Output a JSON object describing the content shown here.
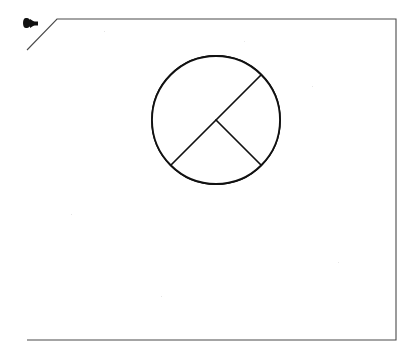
{
  "document": {
    "title": "Shaded circle sector figure",
    "background_color": "#ffffff",
    "page_frame": {
      "name": "scanned-page-border",
      "stroke_color": "#4a4a4a",
      "clipped_corner": "top-left",
      "corners": [
        {
          "x": 27,
          "y": 50
        },
        {
          "x": 57,
          "y": 19
        },
        {
          "x": 396,
          "y": 19
        },
        {
          "x": 396,
          "y": 340
        },
        {
          "x": 27,
          "y": 340
        }
      ]
    },
    "corner_mark": {
      "name": "arrow-pointer-mark",
      "description": "small dark hand-drawn arrow glyph near clipped corner",
      "x": 26,
      "y": 23,
      "color": "#111111"
    }
  },
  "figure": {
    "name": "circle-with-shaded-quarter-sector",
    "circle": {
      "center_x": 216,
      "center_y": 120,
      "radius": 64,
      "stroke_color": "#111111",
      "fill_color": "#ffffff"
    },
    "shaded_sector": {
      "label": "shaded quarter sector",
      "start_angle_deg": -45,
      "end_angle_deg": 45,
      "sweep_deg": 90,
      "fraction_of_circle": 0.25,
      "fill_color": "#a8a8a8",
      "texture": "stipple"
    },
    "lines": [
      {
        "name": "diameter-line",
        "type": "diameter",
        "from": {
          "x": 261,
          "y": 75
        },
        "to": {
          "x": 171,
          "y": 165
        },
        "angle_deg": 45,
        "stroke_color": "#111111"
      },
      {
        "name": "radius-line",
        "type": "radius",
        "from": {
          "x": 216,
          "y": 120
        },
        "to": {
          "x": 261,
          "y": 165
        },
        "angle_deg": -45,
        "stroke_color": "#111111"
      }
    ]
  },
  "chart_data": {
    "type": "pie",
    "title": "",
    "categories": [
      "shaded sector",
      "unshaded region"
    ],
    "values": [
      25,
      75
    ],
    "colors": [
      "#a8a8a8",
      "#ffffff"
    ],
    "legend_position": "none",
    "annotations": []
  }
}
